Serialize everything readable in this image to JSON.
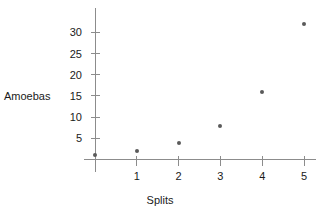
{
  "chart_data": {
    "type": "scatter",
    "title": "",
    "xlabel": "Splits",
    "ylabel": "Amoebas",
    "x": [
      0,
      1,
      2,
      3,
      4,
      5
    ],
    "values": [
      1,
      2,
      4,
      8,
      16,
      32
    ],
    "points": [
      {
        "x": 0,
        "y": 1
      },
      {
        "x": 1,
        "y": 2
      },
      {
        "x": 2,
        "y": 4
      },
      {
        "x": 3,
        "y": 8
      },
      {
        "x": 4,
        "y": 16
      },
      {
        "x": 5,
        "y": 32
      }
    ],
    "xticks": [
      "1",
      "2",
      "3",
      "4",
      "5"
    ],
    "xtick_values": [
      1,
      2,
      3,
      4,
      5
    ],
    "yticks": [
      "5",
      "10",
      "15",
      "20",
      "25",
      "30"
    ],
    "ytick_values": [
      5,
      10,
      15,
      20,
      25,
      30
    ],
    "xlim": [
      -0.35,
      5.45
    ],
    "ylim": [
      -2,
      35
    ],
    "grid": false,
    "legend": false,
    "marker_color": "#5a5a5a",
    "axis_color": "#8c8c8c",
    "text_color": "#1a1a1a",
    "background_color": "#ffffff"
  }
}
